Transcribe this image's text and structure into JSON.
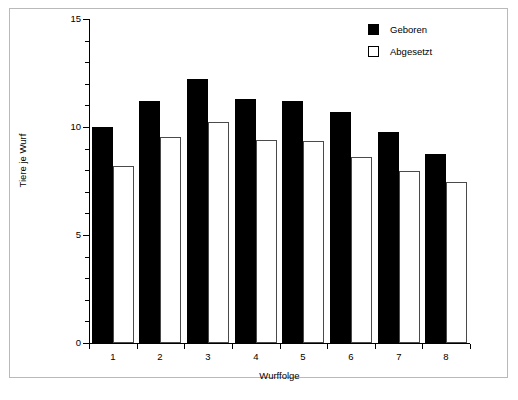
{
  "chart_data": {
    "type": "bar",
    "title": "",
    "xlabel": "Wurffolge",
    "ylabel": "Tiere je Wurf",
    "categories": [
      "1",
      "2",
      "3",
      "4",
      "5",
      "6",
      "7",
      "8"
    ],
    "series": [
      {
        "name": "Geboren",
        "color": "#000000",
        "style": "filled",
        "values": [
          10.0,
          11.2,
          12.2,
          11.3,
          11.2,
          10.7,
          9.75,
          8.75
        ]
      },
      {
        "name": "Abgesetzt",
        "color": "#ffffff",
        "style": "hollow",
        "values": [
          8.2,
          9.55,
          10.25,
          9.4,
          9.35,
          8.6,
          7.95,
          7.45
        ]
      }
    ],
    "ylim": [
      0,
      15
    ],
    "y_ticks_major": [
      0,
      5,
      10,
      15
    ],
    "y_tick_labels": [
      "0",
      "5",
      "10",
      "15"
    ],
    "y_ticks_minor": [
      1,
      2,
      3,
      4,
      6,
      7,
      8,
      9,
      11,
      12,
      13,
      14
    ],
    "xlim": [
      0,
      8
    ],
    "grid": false,
    "legend_position": "top-right"
  },
  "legend": {
    "entries": [
      {
        "label": "Geboren"
      },
      {
        "label": "Abgesetzt"
      }
    ]
  },
  "axes": {
    "x_title": "Wurffolge",
    "y_title": "Tiere je Wurf"
  },
  "colors": {
    "frame_border": "#b9b9b9",
    "axis": "#000000",
    "geboren": "#000000",
    "abgesetzt_outline": "#4a4a4a",
    "background": "#ffffff"
  }
}
